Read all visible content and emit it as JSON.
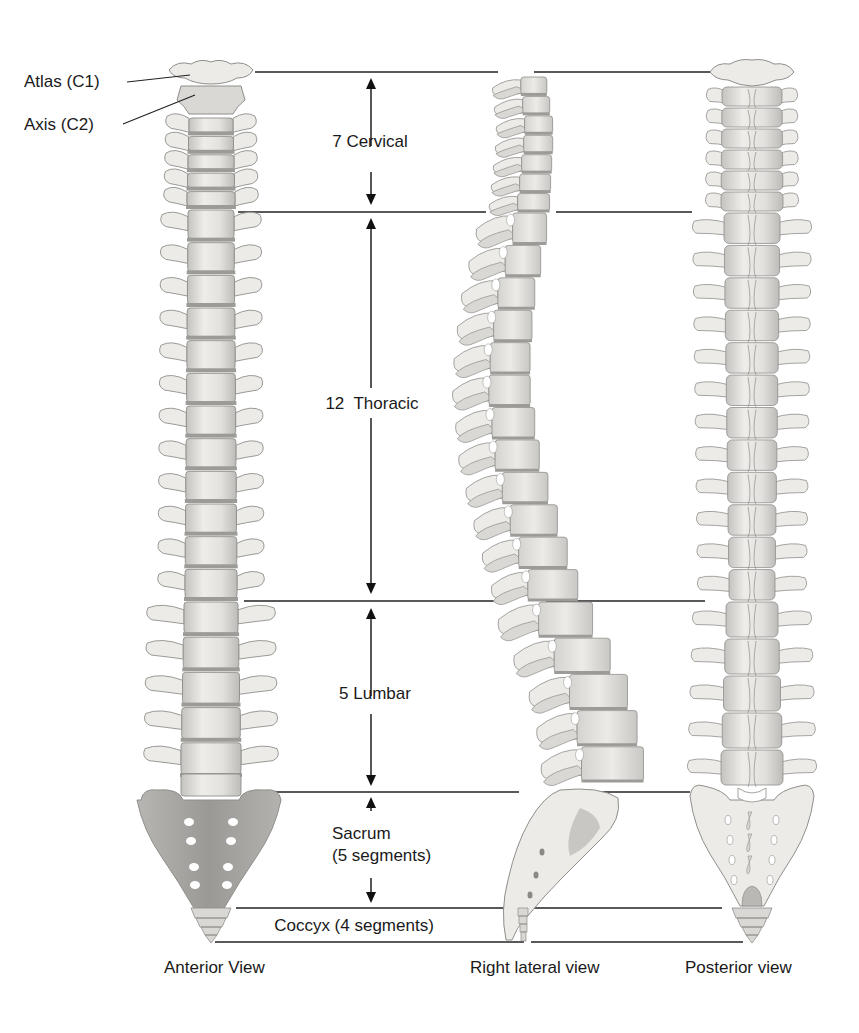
{
  "figure": {
    "background": "#ffffff",
    "colors": {
      "bone_light": "#ecebe8",
      "bone_mid": "#d9d8d5",
      "bone_shadow": "#b9b8b5",
      "bone_outline": "#8f8e8b",
      "disc": "#9c9b98",
      "sacrum_anterior": "#9f9e9b",
      "sacrum_anterior_light": "#c9c8c5",
      "foramen": "#ffffff",
      "leader_line": "#222222",
      "arrow": "#111111"
    }
  },
  "labels": {
    "atlas": "Atlas (C1)",
    "axis": "Axis (C2)",
    "cervical": "7 Cervical",
    "thoracic": "12  Thoracic",
    "lumbar": "5 Lumbar",
    "sacrum_line1": "Sacrum",
    "sacrum_line2": "(5 segments)",
    "coccyx": "Coccyx (4 segments)"
  },
  "views": {
    "anterior": "Anterior View",
    "lateral": "Right lateral view",
    "posterior": "Posterior view"
  },
  "regions": [
    {
      "name": "cervical",
      "count": 7,
      "y_top": 72,
      "y_bottom": 212
    },
    {
      "name": "thoracic",
      "count": 12,
      "y_top": 212,
      "y_bottom": 601
    },
    {
      "name": "lumbar",
      "count": 5,
      "y_top": 601,
      "y_bottom": 792
    },
    {
      "name": "sacrum",
      "count": 5,
      "y_top": 792,
      "y_bottom": 908
    },
    {
      "name": "coccyx",
      "count": 4,
      "y_top": 908,
      "y_bottom": 942
    }
  ],
  "boundary_lines": [
    {
      "y": 72,
      "segments": [
        [
          255,
          498
        ],
        [
          534,
          713
        ]
      ]
    },
    {
      "y": 212,
      "segments": [
        [
          238,
          486
        ],
        [
          556,
          692
        ]
      ]
    },
    {
      "y": 601,
      "segments": [
        [
          244,
          503
        ],
        [
          546,
          705
        ]
      ]
    },
    {
      "y": 792,
      "segments": [
        [
          262,
          519
        ],
        [
          595,
          690
        ]
      ]
    },
    {
      "y": 908,
      "segments": [
        [
          236,
          525
        ],
        [
          534,
          722
        ]
      ]
    },
    {
      "y": 942,
      "segments": [
        [
          215,
          524
        ],
        [
          531,
          743
        ]
      ]
    }
  ],
  "arrows": [
    {
      "region": "cervical",
      "x": 371,
      "y1": 78,
      "y2": 205,
      "gap": [
        146,
        172
      ]
    },
    {
      "region": "thoracic",
      "x": 371,
      "y1": 218,
      "y2": 594,
      "gap": [
        388,
        418
      ]
    },
    {
      "region": "lumbar",
      "x": 371,
      "y1": 608,
      "y2": 786,
      "gap": [
        696,
        714
      ]
    },
    {
      "region": "sacrum",
      "x": 371,
      "y1": 797,
      "y2": 903,
      "gap": [
        811,
        878
      ]
    }
  ],
  "leaders": [
    {
      "label": "atlas",
      "x1": 127,
      "y1": 82,
      "x2": 190,
      "y2": 75
    },
    {
      "label": "axis",
      "x1": 123,
      "y1": 124,
      "x2": 195,
      "y2": 95
    }
  ]
}
